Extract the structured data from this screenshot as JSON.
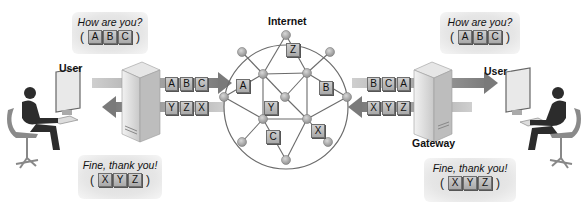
{
  "title": "Internet",
  "left": {
    "user_label": "User",
    "gateway_label": "Gateway",
    "outgoing_bubble": {
      "message": "How are you?",
      "packets": [
        "A",
        "B",
        "C"
      ]
    },
    "incoming_bubble": {
      "message": "Fine, thank you!",
      "packets": [
        "X",
        "Y",
        "Z"
      ]
    },
    "outgoing_row": [
      "A",
      "B",
      "C"
    ],
    "incoming_row": [
      "Y",
      "Z",
      "X"
    ]
  },
  "right": {
    "user_label": "User",
    "gateway_label": "Gateway",
    "received_bubble": {
      "message": "How are you?",
      "packets": [
        "A",
        "B",
        "C"
      ]
    },
    "reply_bubble": {
      "message": "Fine, thank you!",
      "packets": [
        "X",
        "Y",
        "Z"
      ]
    },
    "incoming_row": [
      "B",
      "C",
      "A"
    ],
    "outgoing_row": [
      "X",
      "Y",
      "Z"
    ]
  },
  "network": {
    "packets_in_transit": [
      {
        "label": "Z",
        "x": 292,
        "y": 49
      },
      {
        "label": "A",
        "x": 239,
        "y": 83
      },
      {
        "label": "B",
        "x": 321,
        "y": 86
      },
      {
        "label": "Y",
        "x": 267,
        "y": 105
      },
      {
        "label": "C",
        "x": 268,
        "y": 131
      },
      {
        "label": "X",
        "x": 313,
        "y": 127
      }
    ]
  },
  "colors": {
    "node": "#9a9a9a",
    "line": "#6b6b6b",
    "packet": "#b9b9b9",
    "arrow": "#8a8a8a"
  }
}
